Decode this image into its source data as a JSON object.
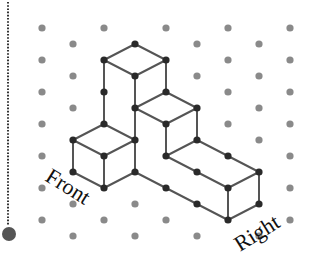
{
  "diagram": {
    "colors": {
      "background": "#ffffff",
      "grid_dot": "#8a8a8a",
      "edge": "#555555",
      "vertex": "#2a2a2a",
      "guide_line": "#333333",
      "guide_ball": "#555555"
    },
    "grid": {
      "even_columns_x": [
        42,
        104,
        166,
        228,
        290
      ],
      "odd_columns_x": [
        73,
        135,
        197,
        259
      ],
      "even_rows_y": [
        28,
        60,
        92,
        124,
        156,
        188,
        220
      ],
      "odd_rows_y": [
        44,
        76,
        108,
        140,
        172,
        204,
        236
      ],
      "dot_radius": 3.6
    },
    "vertices": [
      [
        135,
        44
      ],
      [
        104,
        60
      ],
      [
        166,
        60
      ],
      [
        135,
        76
      ],
      [
        104,
        92
      ],
      [
        166,
        92
      ],
      [
        104,
        124
      ],
      [
        135,
        108
      ],
      [
        197,
        108
      ],
      [
        166,
        124
      ],
      [
        73,
        140
      ],
      [
        135,
        140
      ],
      [
        104,
        156
      ],
      [
        73,
        172
      ],
      [
        135,
        172
      ],
      [
        104,
        188
      ],
      [
        197,
        140
      ],
      [
        166,
        156
      ],
      [
        197,
        172
      ],
      [
        228,
        156
      ],
      [
        259,
        172
      ],
      [
        228,
        188
      ],
      [
        166,
        188
      ],
      [
        197,
        204
      ],
      [
        259,
        204
      ],
      [
        228,
        220
      ]
    ],
    "edges": [
      [
        [
          104,
          60
        ],
        [
          135,
          44
        ]
      ],
      [
        [
          135,
          44
        ],
        [
          166,
          60
        ]
      ],
      [
        [
          104,
          60
        ],
        [
          135,
          76
        ]
      ],
      [
        [
          135,
          76
        ],
        [
          166,
          60
        ]
      ],
      [
        [
          104,
          60
        ],
        [
          104,
          124
        ]
      ],
      [
        [
          135,
          76
        ],
        [
          135,
          108
        ]
      ],
      [
        [
          166,
          60
        ],
        [
          166,
          92
        ]
      ],
      [
        [
          135,
          108
        ],
        [
          166,
          92
        ]
      ],
      [
        [
          166,
          92
        ],
        [
          197,
          108
        ]
      ],
      [
        [
          135,
          108
        ],
        [
          166,
          124
        ]
      ],
      [
        [
          166,
          124
        ],
        [
          197,
          108
        ]
      ],
      [
        [
          197,
          108
        ],
        [
          197,
          140
        ]
      ],
      [
        [
          166,
          124
        ],
        [
          166,
          156
        ]
      ],
      [
        [
          135,
          108
        ],
        [
          135,
          140
        ]
      ],
      [
        [
          73,
          140
        ],
        [
          104,
          124
        ]
      ],
      [
        [
          104,
          124
        ],
        [
          135,
          140
        ]
      ],
      [
        [
          73,
          140
        ],
        [
          104,
          156
        ]
      ],
      [
        [
          104,
          156
        ],
        [
          135,
          140
        ]
      ],
      [
        [
          73,
          140
        ],
        [
          73,
          172
        ]
      ],
      [
        [
          104,
          156
        ],
        [
          104,
          188
        ]
      ],
      [
        [
          135,
          140
        ],
        [
          135,
          172
        ]
      ],
      [
        [
          73,
          172
        ],
        [
          104,
          188
        ]
      ],
      [
        [
          104,
          188
        ],
        [
          135,
          172
        ]
      ],
      [
        [
          166,
          156
        ],
        [
          197,
          140
        ]
      ],
      [
        [
          197,
          140
        ],
        [
          259,
          172
        ]
      ],
      [
        [
          166,
          156
        ],
        [
          228,
          188
        ]
      ],
      [
        [
          228,
          188
        ],
        [
          259,
          172
        ]
      ],
      [
        [
          228,
          188
        ],
        [
          228,
          220
        ]
      ],
      [
        [
          259,
          172
        ],
        [
          259,
          204
        ]
      ],
      [
        [
          135,
          172
        ],
        [
          228,
          220
        ]
      ],
      [
        [
          228,
          220
        ],
        [
          259,
          204
        ]
      ]
    ],
    "labels": {
      "front": {
        "text": "Front",
        "x": 44,
        "y": 180,
        "rotate": 32
      },
      "right": {
        "text": "Right",
        "x": 240,
        "y": 252,
        "rotate": -32
      }
    },
    "guide": {
      "line_x": 8,
      "line_top": 2,
      "line_bottom": 225,
      "ball_cx": 9,
      "ball_cy": 234,
      "ball_r": 7
    }
  }
}
